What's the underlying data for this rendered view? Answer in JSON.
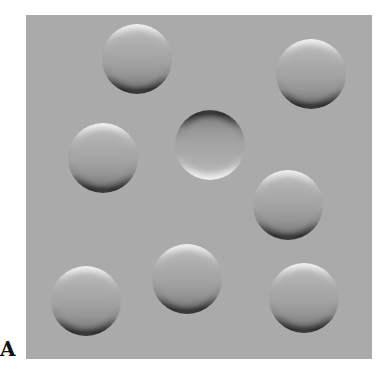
{
  "figure": {
    "label": "A",
    "panel": {
      "background_color": "#aaaaaa",
      "x": 26,
      "y": 15,
      "width": 346,
      "height": 344
    },
    "discs": [
      {
        "id": "disc-1",
        "cx": 137,
        "cy": 59,
        "r": 35,
        "shading": "convex"
      },
      {
        "id": "disc-2",
        "cx": 311,
        "cy": 74,
        "r": 35,
        "shading": "convex"
      },
      {
        "id": "disc-3",
        "cx": 103,
        "cy": 158,
        "r": 35,
        "shading": "convex"
      },
      {
        "id": "disc-4",
        "cx": 210,
        "cy": 145,
        "r": 35,
        "shading": "concave"
      },
      {
        "id": "disc-5",
        "cx": 288,
        "cy": 205,
        "r": 35,
        "shading": "convex"
      },
      {
        "id": "disc-6",
        "cx": 86,
        "cy": 301,
        "r": 35,
        "shading": "convex"
      },
      {
        "id": "disc-7",
        "cx": 187,
        "cy": 279,
        "r": 35,
        "shading": "convex"
      },
      {
        "id": "disc-8",
        "cx": 304,
        "cy": 298,
        "r": 35,
        "shading": "convex"
      }
    ]
  }
}
